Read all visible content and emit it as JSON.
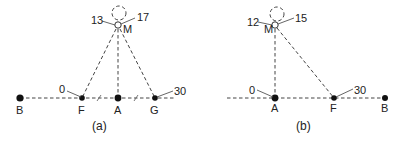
{
  "figures": [
    {
      "id": "a",
      "caption": "(a)",
      "points": {
        "B": {
          "label": "B",
          "x": 20,
          "y": 98,
          "filled": true
        },
        "F": {
          "label": "F",
          "x": 82,
          "y": 98,
          "filled": true,
          "value": "0"
        },
        "A": {
          "label": "A",
          "x": 118,
          "y": 98,
          "filled": true
        },
        "G": {
          "label": "G",
          "x": 155,
          "y": 98,
          "filled": true,
          "value": "30"
        },
        "M": {
          "label": "M",
          "x": 118,
          "y": 25,
          "filled": false,
          "left_value": "13",
          "right_value": "17"
        }
      },
      "equal_segment_marks": [
        "F-A",
        "A-G"
      ]
    },
    {
      "id": "b",
      "caption": "(b)",
      "points": {
        "A": {
          "label": "A",
          "x": 275,
          "y": 98,
          "filled": true,
          "value": "0"
        },
        "F": {
          "label": "F",
          "x": 334,
          "y": 98,
          "filled": true,
          "value": "30"
        },
        "B": {
          "label": "B",
          "x": 385,
          "y": 98,
          "filled": true
        },
        "M": {
          "label": "M",
          "x": 275,
          "y": 25,
          "filled": false,
          "left_value": "12",
          "right_value": "15"
        }
      }
    }
  ]
}
